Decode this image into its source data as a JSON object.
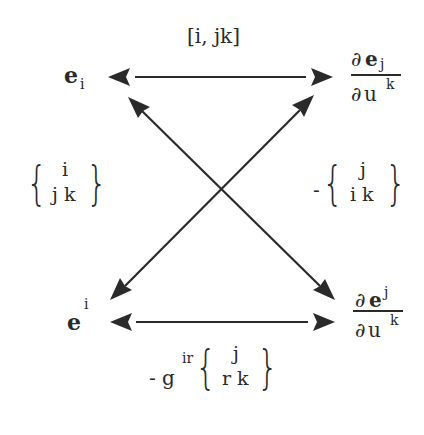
{
  "diagram": {
    "title": "",
    "nodes": {
      "top_left": {
        "base": "e",
        "index": "i",
        "index_pos": "sub"
      },
      "top_right": {
        "num_partial": "∂",
        "num_base": "e",
        "num_index": "j",
        "num_index_pos": "sub",
        "den_partial": "∂",
        "den_base": "u",
        "den_index": "k"
      },
      "bottom_left": {
        "base": "e",
        "index": "i",
        "index_pos": "sup"
      },
      "bottom_right": {
        "num_partial": "∂",
        "num_base": "e",
        "num_index": "j",
        "num_index_pos": "sup",
        "den_partial": "∂",
        "den_base": "u",
        "den_index": "k"
      }
    },
    "edge_labels": {
      "top": "[i, jk]",
      "left": {
        "top": "i",
        "bottom": "j k"
      },
      "right": {
        "sign": "-",
        "top": "j",
        "bottom": "i k"
      },
      "bottom": {
        "prefix": "- g",
        "prefix_sup": "ir",
        "top": "j",
        "bottom": "r k"
      }
    },
    "edges": [
      {
        "from": "top_right",
        "to": "top_left",
        "style": "double-arrow",
        "label": "top"
      },
      {
        "from": "bottom_right",
        "to": "bottom_left",
        "style": "double-arrow",
        "label": "bottom"
      },
      {
        "from": "top_left",
        "to": "bottom_right",
        "style": "double-arrow"
      },
      {
        "from": "bottom_left",
        "to": "top_right",
        "style": "double-arrow"
      }
    ],
    "colors": {
      "ink": "#2a2a2a",
      "background": "#ffffff"
    }
  }
}
